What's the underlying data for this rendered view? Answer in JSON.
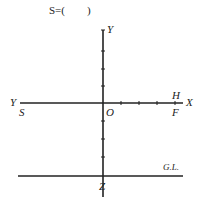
{
  "header": {
    "text": "S=(        )"
  },
  "diagram": {
    "labels": {
      "y_top": "Y",
      "y_left": "Y",
      "s": "S",
      "o": "O",
      "h": "H",
      "f": "F",
      "x": "X",
      "gl": "G.L.",
      "z": "Z"
    },
    "colors": {
      "line": "#222222"
    }
  }
}
